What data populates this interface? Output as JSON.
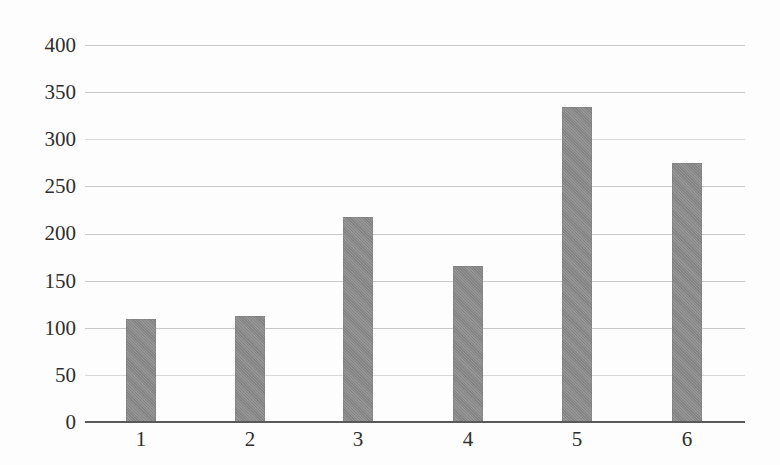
{
  "chart_data": {
    "type": "bar",
    "title": "",
    "subtitle": "",
    "xlabel": "",
    "ylabel": "",
    "categories": [
      "1",
      "2",
      "3",
      "4",
      "5",
      "6"
    ],
    "values": [
      109,
      112,
      217,
      166,
      334,
      275
    ],
    "series": [
      {
        "name": "",
        "values": [
          109,
          112,
          217,
          166,
          334,
          275
        ]
      }
    ],
    "ylim": [
      0,
      400
    ],
    "y_ticks": [
      0,
      50,
      100,
      150,
      200,
      250,
      300,
      350,
      400
    ],
    "y_tick_labels": [
      "0",
      "50",
      "100",
      "150",
      "200",
      "250",
      "300",
      "350",
      "400"
    ],
    "x_tick_labels": [
      "1",
      "2",
      "3",
      "4",
      "5",
      "6"
    ],
    "grid": true,
    "grid_axis": "y",
    "legend": false,
    "legend_position": "none",
    "annotations": [],
    "colors": {
      "bar_fill": "#8a8a8a",
      "gridline": "#c9c9c9",
      "axis_line": "#595959",
      "tick_label": "#2e2e2e",
      "background": "#fdfdfd"
    }
  }
}
